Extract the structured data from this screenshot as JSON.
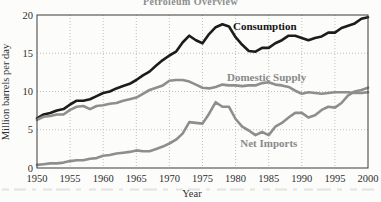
{
  "figure": {
    "clipped_title": "Petroleum Overview",
    "colors": {
      "background": "#fcfcfb",
      "consumption_line": "#1c1c1c",
      "supply_import_lines": "#8e8e8e",
      "grid": "#b0b0b0",
      "plot_border": "#3a3a3a",
      "axis_text": "#2e2e2e",
      "gray_label": "#8a8a8a",
      "clipped_caption_artifact": "#cfcfcf"
    }
  },
  "chart_data": {
    "type": "line",
    "title": "Petroleum Overview",
    "xlabel": "Year",
    "ylabel": "Million barrels per day",
    "xlim": [
      1950,
      2000
    ],
    "ylim": [
      0,
      20
    ],
    "x_ticks": [
      1950,
      1955,
      1960,
      1965,
      1970,
      1975,
      1980,
      1985,
      1990,
      1995,
      2000
    ],
    "y_ticks": [
      0,
      5,
      10,
      15,
      20
    ],
    "grid": "dotted",
    "legend_position": "inline-labels",
    "x": [
      1950,
      1951,
      1952,
      1953,
      1954,
      1955,
      1956,
      1957,
      1958,
      1959,
      1960,
      1961,
      1962,
      1963,
      1964,
      1965,
      1966,
      1967,
      1968,
      1969,
      1970,
      1971,
      1972,
      1973,
      1974,
      1975,
      1976,
      1977,
      1978,
      1979,
      1980,
      1981,
      1982,
      1983,
      1984,
      1985,
      1986,
      1987,
      1988,
      1989,
      1990,
      1991,
      1992,
      1993,
      1994,
      1995,
      1996,
      1997,
      1998,
      1999,
      2000
    ],
    "series": [
      {
        "name": "Consumption",
        "color": "#1c1c1c",
        "values": [
          6.5,
          7.0,
          7.2,
          7.5,
          7.7,
          8.3,
          8.8,
          8.8,
          9.0,
          9.4,
          9.8,
          10.0,
          10.4,
          10.7,
          11.0,
          11.5,
          12.1,
          12.6,
          13.4,
          14.1,
          14.7,
          15.2,
          16.4,
          17.3,
          16.7,
          16.3,
          17.5,
          18.4,
          18.8,
          18.5,
          17.1,
          16.1,
          15.3,
          15.2,
          15.7,
          15.7,
          16.3,
          16.7,
          17.3,
          17.3,
          17.0,
          16.7,
          17.0,
          17.2,
          17.7,
          17.7,
          18.3,
          18.6,
          18.9,
          19.5,
          19.7
        ]
      },
      {
        "name": "Domestic Supply",
        "color": "#8e8e8e",
        "values": [
          6.3,
          6.7,
          6.8,
          7.0,
          7.0,
          7.6,
          8.0,
          8.1,
          7.7,
          8.1,
          8.2,
          8.4,
          8.5,
          8.8,
          9.0,
          9.2,
          9.7,
          10.2,
          10.5,
          10.8,
          11.4,
          11.5,
          11.5,
          11.3,
          10.9,
          10.5,
          10.4,
          10.6,
          10.9,
          10.8,
          10.8,
          10.7,
          10.8,
          10.8,
          11.1,
          11.2,
          10.9,
          10.8,
          10.6,
          10.1,
          9.7,
          9.9,
          9.8,
          9.7,
          9.8,
          9.9,
          9.9,
          9.9,
          9.8,
          9.8,
          9.9
        ]
      },
      {
        "name": "Net Imports",
        "color": "#8e8e8e",
        "values": [
          0.4,
          0.5,
          0.6,
          0.6,
          0.7,
          0.9,
          1.0,
          1.0,
          1.2,
          1.3,
          1.6,
          1.7,
          1.9,
          2.0,
          2.1,
          2.3,
          2.2,
          2.2,
          2.5,
          2.8,
          3.2,
          3.7,
          4.5,
          6.0,
          5.9,
          5.8,
          7.1,
          8.6,
          8.0,
          8.0,
          6.4,
          5.4,
          4.9,
          4.3,
          4.7,
          4.3,
          5.4,
          5.9,
          6.6,
          7.2,
          7.2,
          6.6,
          6.9,
          7.6,
          8.0,
          7.9,
          8.5,
          9.5,
          10.0,
          10.2,
          10.5
        ]
      }
    ],
    "annotations": [
      {
        "text": "Consumption",
        "year": 1979.6,
        "value": 18.1,
        "style": "dark"
      },
      {
        "text": "Domestic Supply",
        "year": 1978.7,
        "value": 11.4,
        "style": "gray"
      },
      {
        "text": "Net Imports",
        "year": 1980.7,
        "value": 2.8,
        "style": "gray"
      }
    ]
  }
}
